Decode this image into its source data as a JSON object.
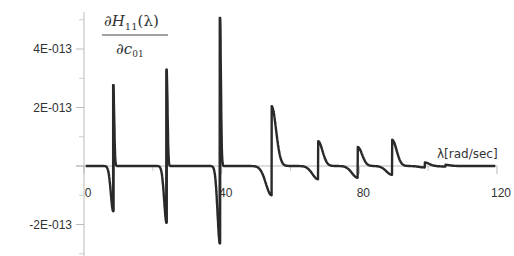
{
  "chart_data": {
    "type": "line",
    "title": "",
    "ylabel": {
      "numerator": "∂H",
      "sub": "11",
      "arg": "(λ)",
      "denominator": "∂c",
      "den_sub": "01"
    },
    "xlabel": "λ[rad/sec]",
    "xlim": [
      0,
      120
    ],
    "ylim": [
      -3e-13,
      5.2e-13
    ],
    "x_ticks": [
      {
        "v": 0,
        "label": "0"
      },
      {
        "v": 40,
        "label": "40"
      },
      {
        "v": 80,
        "label": "80"
      },
      {
        "v": 120,
        "label": "120"
      }
    ],
    "x_minor_ticks": [
      20,
      60,
      100
    ],
    "y_ticks": [
      {
        "v": 4e-13,
        "label": "4E-013"
      },
      {
        "v": 2e-13,
        "label": "2E-013"
      },
      {
        "v": 0,
        "label": ""
      },
      {
        "v": -2e-13,
        "label": "-2E-013"
      }
    ],
    "y_minor_ticks": [
      5e-13,
      3e-13,
      1e-13,
      -1e-13,
      -3e-13
    ],
    "grid": false,
    "line_color": "#2a2a2a",
    "resonances": [
      {
        "x": 8.5,
        "peak": 2.8e-13,
        "trough": -1.55e-13,
        "sharp": true
      },
      {
        "x": 24.0,
        "peak": 3.3e-13,
        "trough": -1.95e-13,
        "sharp": true
      },
      {
        "x": 39.5,
        "peak": 5.1e-13,
        "trough": -2.65e-13,
        "sharp": true
      },
      {
        "x": 54.5,
        "peak": 2.05e-13,
        "trough": -1e-13,
        "sharp": false
      },
      {
        "x": 68.0,
        "peak": 8.5e-14,
        "trough": -4.5e-14,
        "sharp": false
      },
      {
        "x": 79.5,
        "peak": 6.5e-14,
        "trough": -4e-14,
        "sharp": false
      },
      {
        "x": 89.5,
        "peak": 9e-14,
        "trough": -3e-14,
        "sharp": false
      },
      {
        "x": 99.0,
        "peak": 1.2e-14,
        "trough": -5e-15,
        "sharp": false
      },
      {
        "x": 105.0,
        "peak": 4e-15,
        "trough": -2e-15,
        "sharp": false
      }
    ]
  }
}
